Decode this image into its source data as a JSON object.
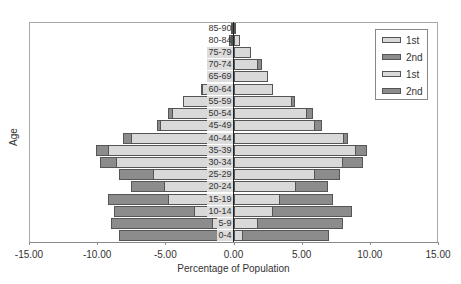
{
  "chart_data": {
    "type": "bar",
    "orientation": "horizontal",
    "subtype": "population-pyramid",
    "title": "",
    "xlabel": "Percentage of Population",
    "ylabel": "Age",
    "xlim": [
      -15,
      15
    ],
    "x_ticks": [
      "-15.00",
      "-10.00",
      "-5.00",
      "0.00",
      "5.00",
      "10.00",
      "15.00"
    ],
    "x_tick_values": [
      -15,
      -10,
      -5,
      0,
      5,
      10,
      15
    ],
    "grid": false,
    "legend_position": "upper right",
    "categories": [
      "0-4",
      "5-9",
      "10-14",
      "15-19",
      "20-24",
      "25-29",
      "30-34",
      "35-39",
      "40-44",
      "45-49",
      "50-54",
      "55-59",
      "60-64",
      "65-69",
      "70-74",
      "75-79",
      "80-84",
      "85-90"
    ],
    "series": [
      {
        "name": "1st",
        "side": "left",
        "color": "#d9d9d9",
        "values": [
          -1.0,
          -1.6,
          -2.9,
          -4.8,
          -5.1,
          -5.9,
          -8.6,
          -9.2,
          -7.5,
          -5.4,
          -4.5,
          -3.7,
          -2.3,
          -1.5,
          -0.9,
          -0.7,
          -0.2,
          -0.1
        ]
      },
      {
        "name": "2nd",
        "side": "left",
        "color": "#8c8c8c",
        "values": [
          -7.4,
          -7.4,
          -5.9,
          -4.4,
          -2.4,
          -2.5,
          -1.2,
          -0.9,
          -0.6,
          -0.2,
          -0.3,
          -0.0,
          -0.1,
          -0.3,
          -0.1,
          -0.2,
          -0.1,
          -0.05
        ]
      },
      {
        "name": "1st",
        "side": "right",
        "color": "#d9d9d9",
        "values": [
          0.7,
          1.8,
          2.9,
          3.4,
          4.6,
          6.0,
          8.0,
          9.0,
          8.1,
          6.0,
          5.4,
          4.3,
          2.9,
          2.5,
          1.8,
          1.3,
          0.45,
          0.2
        ]
      },
      {
        "name": "2nd",
        "side": "right",
        "color": "#8c8c8c",
        "values": [
          6.3,
          6.2,
          5.8,
          3.9,
          2.3,
          1.8,
          1.5,
          0.8,
          0.3,
          0.5,
          0.4,
          0.2,
          0.0,
          0.0,
          0.3,
          0.0,
          0.0,
          0.0
        ]
      }
    ],
    "totals_left": [
      -8.4,
      -9.0,
      -8.8,
      -9.2,
      -7.5,
      -8.4,
      -9.8,
      -10.1,
      -8.1,
      -5.6,
      -4.8,
      -3.7,
      -2.4,
      -1.8,
      -1.0,
      -0.9,
      -0.3,
      -0.15
    ],
    "totals_right": [
      7.0,
      8.0,
      8.7,
      7.3,
      6.9,
      7.8,
      9.5,
      9.8,
      8.4,
      6.5,
      5.8,
      4.5,
      2.9,
      2.5,
      2.1,
      1.3,
      0.45,
      0.2
    ]
  },
  "legend": {
    "items": [
      {
        "label": "1st",
        "color": "#d9d9d9"
      },
      {
        "label": "2nd",
        "color": "#8c8c8c"
      },
      {
        "label": "1st",
        "color": "#d9d9d9"
      },
      {
        "label": "2nd",
        "color": "#8c8c8c"
      }
    ]
  },
  "axes": {
    "xlabel": "Percentage of Population",
    "ylabel": "Age",
    "x_ticks": [
      "-15.00",
      "-10.00",
      "-5.00",
      "0.00",
      "5.00",
      "10.00",
      "15.00"
    ]
  }
}
